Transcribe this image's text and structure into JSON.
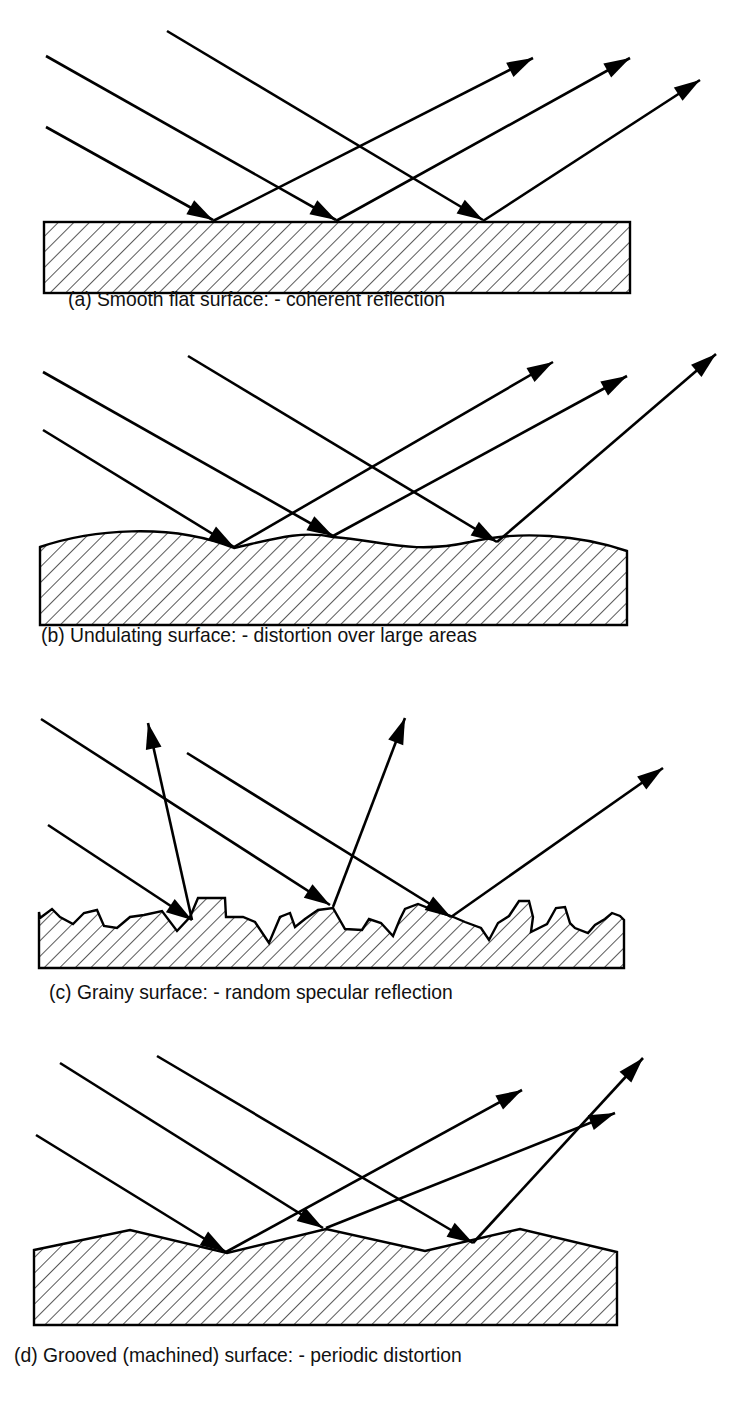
{
  "figure": {
    "panels": [
      {
        "id": "a",
        "caption": "(a) Smooth flat surface: - coherent reflection",
        "surface_type": "smooth-flat",
        "reflection": "coherent"
      },
      {
        "id": "b",
        "caption": "(b) Undulating surface: - distortion over large areas",
        "surface_type": "undulating",
        "reflection": "distortion over large areas"
      },
      {
        "id": "c",
        "caption": "(c) Grainy surface: - random specular reflection",
        "surface_type": "grainy",
        "reflection": "random specular"
      },
      {
        "id": "d",
        "caption": "(d) Grooved (machined) surface: - periodic distortion",
        "surface_type": "grooved-machined",
        "reflection": "periodic distortion"
      }
    ],
    "colors": {
      "ink": "#000000",
      "background": "#ffffff"
    }
  }
}
